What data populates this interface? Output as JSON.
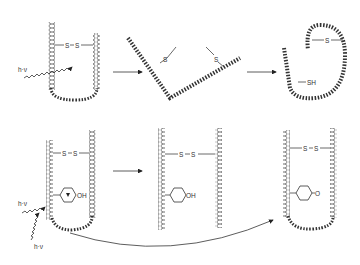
{
  "diagram": {
    "type": "reaction scheme",
    "panels": [
      {
        "id": "top-1",
        "labels": {
          "bond_left": "S",
          "bond_right": "S",
          "light": "h·ν"
        }
      },
      {
        "id": "top-2",
        "labels": {
          "s_left": "S",
          "s_right": "S"
        }
      },
      {
        "id": "top-3",
        "labels": {
          "s_top": "S",
          "sh": "SH"
        }
      },
      {
        "id": "bottom-1",
        "labels": {
          "bond_left": "S",
          "bond_right": "S",
          "oh": "OH",
          "light_1": "h·ν",
          "light_2": "h·ν"
        }
      },
      {
        "id": "bottom-2",
        "labels": {
          "bond_left": "S",
          "bond_right": "S",
          "oh": "OH"
        }
      },
      {
        "id": "bottom-3",
        "labels": {
          "bond_left": "S",
          "bond_right": "S",
          "ketone": "O"
        }
      }
    ],
    "arrows": [
      {
        "from": "top-1",
        "to": "top-2"
      },
      {
        "from": "top-2",
        "to": "top-3"
      },
      {
        "from": "bottom-1",
        "to": "bottom-2"
      },
      {
        "from": "bottom-1",
        "to": "bottom-3",
        "style": "curved"
      }
    ]
  }
}
